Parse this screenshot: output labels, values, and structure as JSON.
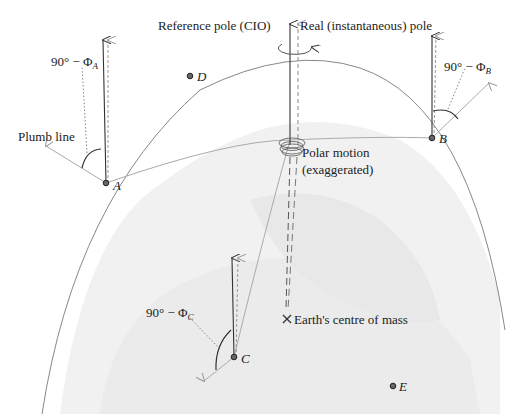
{
  "labels": {
    "reference_pole": "Reference pole (CIO)",
    "real_pole": "Real (instantaneous) pole",
    "plumb_line": "Plumb line",
    "polar_motion_1": "Polar motion",
    "polar_motion_2": "(exaggerated)",
    "centre_of_mass": "Earth's centre of mass",
    "angle_prefix": "90° − Φ",
    "angle_A_sub": "A",
    "angle_B_sub": "B",
    "angle_C_sub": "C"
  },
  "points": [
    {
      "name": "A",
      "x": 106,
      "y": 183
    },
    {
      "name": "B",
      "x": 432,
      "y": 138
    },
    {
      "name": "C",
      "x": 234,
      "y": 357
    },
    {
      "name": "D",
      "x": 190,
      "y": 76
    },
    {
      "name": "E",
      "x": 392,
      "y": 386
    }
  ],
  "colors": {
    "line_dark": "#333333",
    "line_grey": "#999999",
    "earth_fill": "#efefef",
    "text": "#222222"
  }
}
